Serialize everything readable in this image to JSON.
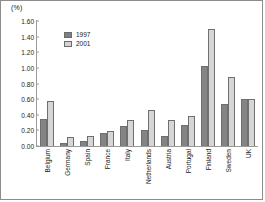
{
  "chart_data": {
    "type": "bar",
    "title": "",
    "subtitle": "",
    "xlabel": "",
    "ylabel": "(%)",
    "unit_label": "(%)",
    "categories": [
      "Belgium",
      "Germany",
      "Spain",
      "France",
      "Italy",
      "Netherlands",
      "Austria",
      "Portugal",
      "Finland",
      "Sweden",
      "UK"
    ],
    "series": [
      {
        "name": "1997",
        "color": "#848484",
        "values": [
          0.34,
          0.04,
          0.06,
          0.17,
          0.26,
          0.21,
          0.13,
          0.27,
          1.03,
          0.54,
          0.6
        ]
      },
      {
        "name": "2001",
        "color": "#d6d6d6",
        "values": [
          0.57,
          0.12,
          0.13,
          0.19,
          0.33,
          0.46,
          0.33,
          0.39,
          1.5,
          0.88,
          0.6
        ]
      }
    ],
    "ylim": [
      0.0,
      1.6
    ],
    "yticks": [
      "0.00",
      "0.20",
      "0.40",
      "0.60",
      "0.80",
      "1.00",
      "1.20",
      "1.40",
      "1.60"
    ],
    "ytick_values": [
      0.0,
      0.2,
      0.4,
      0.6,
      0.8,
      1.0,
      1.2,
      1.4,
      1.6
    ],
    "grid": false,
    "legend_position": "top-left-inside",
    "legend_entries": [
      "1997",
      "2001"
    ]
  },
  "legend": {
    "items": [
      {
        "label": "1997"
      },
      {
        "label": "2001"
      }
    ]
  }
}
